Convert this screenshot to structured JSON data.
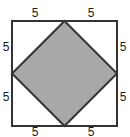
{
  "figure": {
    "background_color": "#ffffff",
    "outer_square": {
      "name": "outer-square",
      "stroke_color": "#333333",
      "stroke_width": 2,
      "fill_color": "#ffffff",
      "left": 12,
      "top": 21,
      "size": 105
    },
    "inner_diamond": {
      "name": "inner-shaded-square",
      "stroke_color": "#333333",
      "stroke_width": 2,
      "fill_color": "#a8a8a8",
      "vertices": [
        {
          "name": "top-vertex",
          "x": 64.5,
          "y": 21
        },
        {
          "name": "right-vertex",
          "x": 117,
          "y": 73.5
        },
        {
          "name": "bottom-vertex",
          "x": 64.5,
          "y": 126
        },
        {
          "name": "left-vertex",
          "x": 12,
          "y": 73.5
        }
      ]
    },
    "labels": [
      {
        "name": "segment-label-top-left",
        "text": "5",
        "side": "top",
        "position": "left-half"
      },
      {
        "name": "segment-label-top-right",
        "text": "5",
        "side": "top",
        "position": "right-half"
      },
      {
        "name": "segment-label-left-upper",
        "text": "5",
        "side": "left",
        "position": "upper-half"
      },
      {
        "name": "segment-label-left-lower",
        "text": "5",
        "side": "left",
        "position": "lower-half"
      },
      {
        "name": "segment-label-right-upper",
        "text": "5",
        "side": "right",
        "position": "upper-half"
      },
      {
        "name": "segment-label-right-lower",
        "text": "5",
        "side": "right",
        "position": "lower-half"
      },
      {
        "name": "segment-label-bottom-left",
        "text": "5",
        "side": "bottom",
        "position": "left-half"
      },
      {
        "name": "segment-label-bottom-right",
        "text": "5",
        "side": "bottom",
        "position": "right-half"
      }
    ]
  }
}
